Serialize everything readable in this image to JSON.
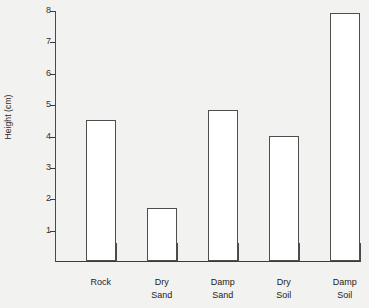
{
  "chart_data": {
    "type": "bar",
    "title": "",
    "xlabel": "",
    "ylabel": "Height (cm)",
    "categories": [
      "Rock",
      "Dry\nSand",
      "Damp\nSand",
      "Dry\nSoil",
      "Damp\nSoil"
    ],
    "values": [
      4.5,
      1.7,
      4.8,
      4.0,
      7.9
    ],
    "ylim": [
      0,
      8
    ],
    "ytick_labels": [
      "8",
      "7",
      "6",
      "5",
      "4",
      "3",
      "2",
      "1"
    ],
    "ytick_values": [
      8,
      7,
      6,
      5,
      4,
      3,
      2,
      1
    ],
    "grid": false,
    "legend": null,
    "bar_fill_color": "#ffffff",
    "bar_edge_color": "#4e4e4e",
    "axis_color": "#3a3a3a",
    "background_color": "#f2f2f0",
    "x_divider_count": 11
  }
}
